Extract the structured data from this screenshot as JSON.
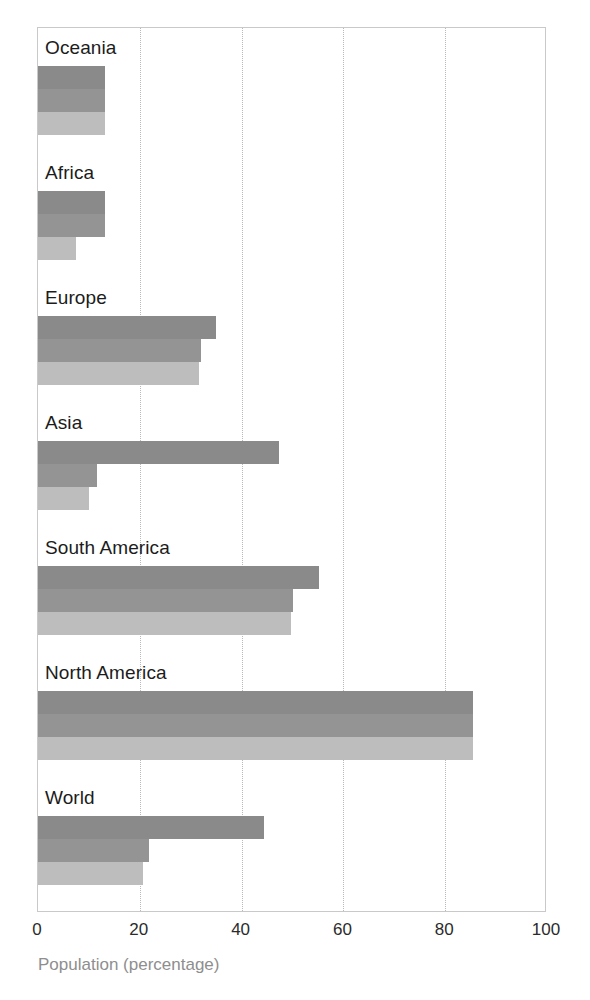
{
  "chart_data": {
    "type": "bar",
    "orientation": "horizontal",
    "title": "",
    "subtitle": "",
    "xlabel": "Population (percentage)",
    "ylabel": "",
    "xlim": [
      0,
      100
    ],
    "xticks": [
      0,
      20,
      40,
      60,
      80,
      100
    ],
    "xtick_labels": [
      "0",
      "20",
      "40",
      "60",
      "80",
      "100"
    ],
    "grid": "vertical-dotted",
    "legend": "none",
    "categories": [
      "Oceania",
      "Africa",
      "Europe",
      "Asia",
      "South America",
      "North America",
      "World"
    ],
    "series": [
      {
        "name": "series-1",
        "color": "#8a8a8a",
        "values": [
          13.2,
          13.2,
          35.0,
          47.3,
          55.2,
          85.5,
          44.4
        ]
      },
      {
        "name": "series-2",
        "color": "#949494",
        "values": [
          13.2,
          13.2,
          32.0,
          11.6,
          50.1,
          85.5,
          21.8
        ]
      },
      {
        "name": "series-3",
        "color": "#bdbdbd",
        "values": [
          13.2,
          7.5,
          31.6,
          10.0,
          49.7,
          85.5,
          20.6
        ]
      }
    ]
  },
  "colors": {
    "series_1": "#8a8a8a",
    "series_2": "#949494",
    "series_3": "#bdbdbd",
    "frame": "#c9c9c9",
    "gridline": "#b9b9b9",
    "label_text": "#1c1c1c",
    "tick_text": "#2b2b2b",
    "axis_title_text": "#8e8e8e",
    "background": "#ffffff"
  }
}
